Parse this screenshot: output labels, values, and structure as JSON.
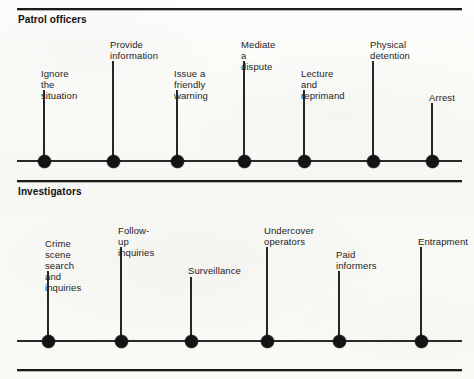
{
  "figure": {
    "kind": "two-stacked-discretion-scales",
    "ink_color": "#141414",
    "paper_color": "#fbfbf9"
  },
  "sections": [
    {
      "id": "patrol-officers",
      "title": "Patrol officers",
      "nodes": [
        {
          "label": "Ignore the\nsituation",
          "x": 43,
          "stem_top": 90,
          "label_top": 68
        },
        {
          "label": "Provide\ninformation",
          "x": 112,
          "stem_top": 61,
          "label_top": 39
        },
        {
          "label": "Issue a\nfriendly warning",
          "x": 176,
          "stem_top": 90,
          "label_top": 68
        },
        {
          "label": "Mediate\na dispute",
          "x": 243,
          "stem_top": 61,
          "label_top": 39
        },
        {
          "label": "Lecture\nand reprimand",
          "x": 303,
          "stem_top": 90,
          "label_top": 68
        },
        {
          "label": "Physical\ndetention",
          "x": 372,
          "stem_top": 61,
          "label_top": 39
        },
        {
          "label": "Arrest",
          "x": 431,
          "stem_top": 103,
          "label_top": 92
        }
      ]
    },
    {
      "id": "investigators",
      "title": "Investigators",
      "nodes": [
        {
          "label": "Crime scene\nsearch and\ninquiries",
          "x": 47,
          "stem_top": 91,
          "label_top": 58
        },
        {
          "label": "Follow-up\ninquiries",
          "x": 120,
          "stem_top": 67,
          "label_top": 45
        },
        {
          "label": "Surveillance",
          "x": 190,
          "stem_top": 97,
          "label_top": 85
        },
        {
          "label": "Undercover\noperators",
          "x": 266,
          "stem_top": 67,
          "label_top": 45
        },
        {
          "label": "Paid\ninformers",
          "x": 338,
          "stem_top": 91,
          "label_top": 69
        },
        {
          "label": "Entrapment",
          "x": 420,
          "stem_top": 67,
          "label_top": 56
        }
      ]
    }
  ]
}
